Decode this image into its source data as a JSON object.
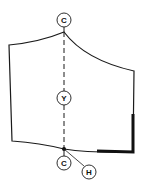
{
  "diagram": {
    "type": "sewing-pattern-piece",
    "colors": {
      "line": "#1a1a1a",
      "background": "#ffffff"
    },
    "markers": [
      {
        "id": "top-c",
        "label": "C",
        "cx": 64,
        "cy": 20
      },
      {
        "id": "mid-y",
        "label": "Y",
        "cx": 64,
        "cy": 98
      },
      {
        "id": "bottom-c",
        "label": "C",
        "cx": 64,
        "cy": 163
      },
      {
        "id": "bottom-h",
        "label": "H",
        "cx": 89,
        "cy": 172
      }
    ],
    "lines": {
      "center_fold": "dashed",
      "bold_edge": "thick"
    }
  }
}
